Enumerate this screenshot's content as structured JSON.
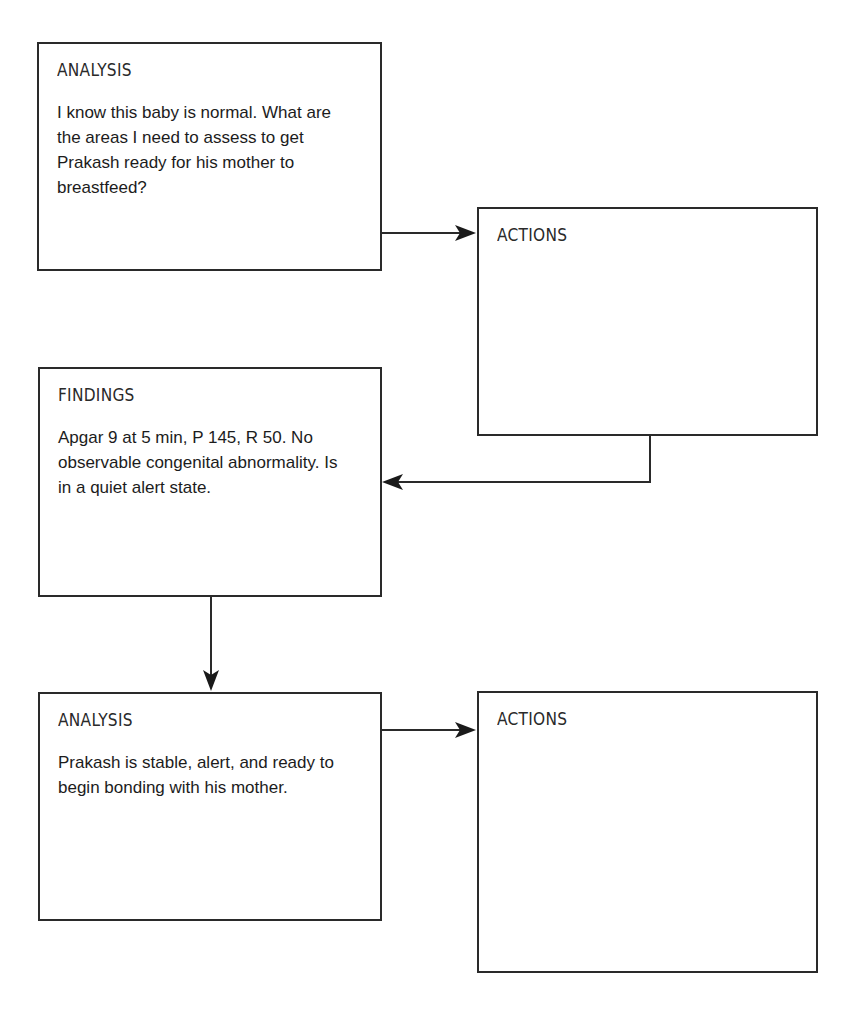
{
  "diagram": {
    "boxes": [
      {
        "id": "analysis-1",
        "title": "ANALYSIS",
        "body": "I know this baby is normal. What are the areas I need to assess to get Prakash ready for his mother to breastfeed?"
      },
      {
        "id": "actions-1",
        "title": "ACTIONS",
        "body": ""
      },
      {
        "id": "findings-1",
        "title": "FINDINGS",
        "body": "Apgar 9 at 5 min, P 145, R 50. No observable congenital abnormality. Is in a quiet alert state."
      },
      {
        "id": "analysis-2",
        "title": "ANALYSIS",
        "body": "Prakash is stable, alert, and ready to begin bonding with his mother."
      },
      {
        "id": "actions-2",
        "title": "ACTIONS",
        "body": ""
      }
    ],
    "connectors": [
      {
        "from": "analysis-1",
        "to": "actions-1",
        "direction": "right"
      },
      {
        "from": "actions-1",
        "to": "findings-1",
        "direction": "down-then-left"
      },
      {
        "from": "findings-1",
        "to": "analysis-2",
        "direction": "down"
      },
      {
        "from": "analysis-2",
        "to": "actions-2",
        "direction": "right"
      }
    ],
    "colors": {
      "stroke": "#2a2a2a",
      "background": "#ffffff"
    }
  }
}
